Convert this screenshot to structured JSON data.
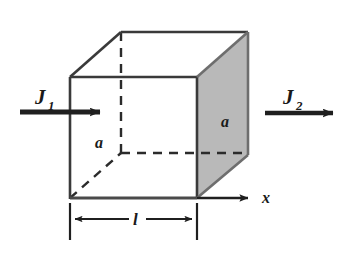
{
  "figure": {
    "type": "physics-diagram",
    "background_color": "#ffffff",
    "line_color": "#2b2b2b",
    "shaded_face_color": "#b9b9b9",
    "shaded_face_edge_color": "#6e6e6e",
    "labels": {
      "flux_in": "J",
      "flux_in_subscript": "1",
      "flux_out": "J",
      "flux_out_subscript": "2",
      "side_front": "a",
      "side_right": "a",
      "length": "l",
      "axis": "x"
    },
    "geometry": {
      "front_face": {
        "left": 70,
        "right": 197,
        "top": 77,
        "bottom": 198
      },
      "back_offset": {
        "dx": 51,
        "dy": -45
      },
      "arrow_flux_in": {
        "x1": 20,
        "y1": 112,
        "x2": 108,
        "y2": 112
      },
      "arrow_flux_out": {
        "x1": 265,
        "y1": 113,
        "x2": 342,
        "y2": 113
      },
      "arrow_axis": {
        "x1": 197,
        "y1": 198,
        "x2": 256,
        "y2": 198
      },
      "dimension_line": {
        "y": 219,
        "x1": 70,
        "x2": 197,
        "tick_top": 203,
        "tick_bottom": 240
      }
    }
  }
}
